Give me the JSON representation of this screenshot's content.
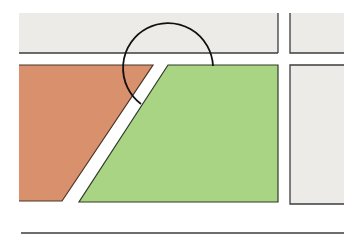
{
  "diagram": {
    "title": "",
    "colors": {
      "background": "#ffffff",
      "gray_block": "#ecebe8",
      "orange_lot": "#d9906c",
      "green_lot": "#a8d483",
      "outline": "#3d3d3d",
      "arc": "#111111"
    },
    "regions": [
      {
        "name": "top-gray-block",
        "shape": "rect",
        "x": 19,
        "y": 13,
        "w": 259,
        "h": 40
      },
      {
        "name": "top-right-gray-block",
        "shape": "rect",
        "x": 290,
        "y": 13,
        "w": 54,
        "h": 40
      },
      {
        "name": "orange-lot",
        "shape": "polygon",
        "points": "19,65 153,65 62,201 19,201"
      },
      {
        "name": "green-lot",
        "shape": "polygon",
        "points": "168,65 278,65 278,202 79,202"
      },
      {
        "name": "bottom-right-gray-block",
        "shape": "rect",
        "x": 290,
        "y": 65,
        "w": 54,
        "h": 139
      }
    ],
    "arc": {
      "path": "M 141 104 A 45 45 0 1 1 213 66"
    },
    "baseline": {
      "x1": 21,
      "y1": 233,
      "x2": 344,
      "y2": 233
    }
  }
}
